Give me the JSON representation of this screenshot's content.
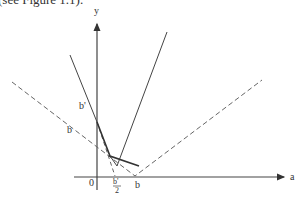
{
  "caption": "(see Figure 1.1).",
  "axes": {
    "x_label": "a",
    "y_label": "y",
    "origin_label": "0"
  },
  "labels": {
    "b_prime": "b'",
    "b": "b",
    "b_prime_half_num": "b'",
    "b_prime_half_den": "2",
    "b_axis": "b"
  },
  "colors": {
    "line": "#444444",
    "dashed": "#666666"
  }
}
